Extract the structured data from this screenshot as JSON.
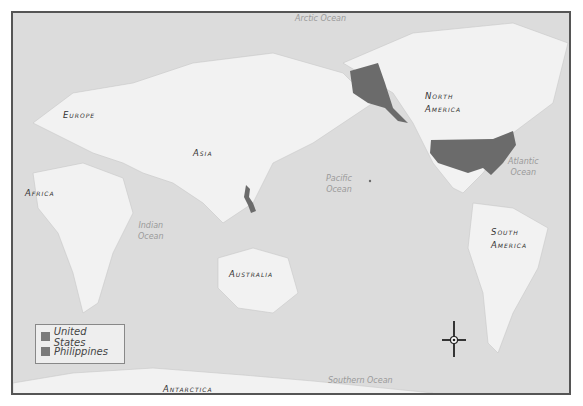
{
  "map": {
    "oceans": [
      {
        "id": "arctic",
        "label": "Arctic Ocean"
      },
      {
        "id": "pacific",
        "label": "Pacific\nOcean"
      },
      {
        "id": "atlantic",
        "label": "Atlantic\nOcean"
      },
      {
        "id": "indian",
        "label": "Indian\nOcean"
      },
      {
        "id": "southern",
        "label": "Southern Ocean"
      }
    ],
    "continents": [
      {
        "id": "europe",
        "label": "Europe"
      },
      {
        "id": "asia",
        "label": "Asia"
      },
      {
        "id": "africa",
        "label": "Africa"
      },
      {
        "id": "australia",
        "label": "Australia"
      },
      {
        "id": "north_america",
        "label": "North\nAmerica"
      },
      {
        "id": "south_america",
        "label": "South\nAmerica"
      },
      {
        "id": "antarctica",
        "label": "Antarctica"
      }
    ],
    "highlight_color": "#6b6b6b"
  },
  "legend": {
    "items": [
      {
        "label": "United States",
        "color": "#7a7a7a"
      },
      {
        "label": "Philippines",
        "color": "#7a7a7a"
      }
    ]
  },
  "compass": {
    "icon": "compass-rose-icon"
  }
}
